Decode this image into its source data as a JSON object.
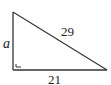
{
  "figure": {
    "type": "right-triangle",
    "labels": {
      "vertical_leg": "a",
      "hypotenuse": "29",
      "horizontal_leg": "21"
    },
    "right_angle_marker": true,
    "colors": {
      "stroke": "#333333",
      "text": "#222222",
      "background": "#ffffff"
    }
  }
}
